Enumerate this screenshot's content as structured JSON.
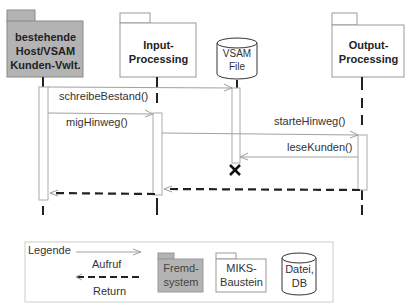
{
  "diagram": {
    "type": "sequence-diagram",
    "participants": [
      {
        "id": "host",
        "label_lines": [
          "bestehende",
          "Host/VSAM",
          "Kunden-Vwlt."
        ],
        "kind": "Fremdsystem",
        "fill": "#b3b3b3"
      },
      {
        "id": "input",
        "label_lines": [
          "Input-",
          "Processing"
        ],
        "kind": "MIKS-Baustein",
        "fill": "#ffffff"
      },
      {
        "id": "vsam",
        "label_lines": [
          "VSAM",
          "File"
        ],
        "kind": "Datei, DB",
        "fill": "#ffffff"
      },
      {
        "id": "output",
        "label_lines": [
          "Output-",
          "Processing"
        ],
        "kind": "MIKS-Baustein",
        "fill": "#ffffff"
      }
    ],
    "messages": [
      {
        "from": "host",
        "to": "vsam",
        "label": "schreibeBestand()",
        "type": "call"
      },
      {
        "from": "host",
        "to": "input",
        "label": "migHinweg()",
        "type": "call"
      },
      {
        "from": "input",
        "to": "output",
        "label": "starteHinweg()",
        "type": "call"
      },
      {
        "from": "output",
        "to": "vsam",
        "label": "leseKunden()",
        "type": "call"
      },
      {
        "from": "output",
        "to": "input",
        "label": "",
        "type": "return"
      },
      {
        "from": "input",
        "to": "host",
        "label": "",
        "type": "return"
      }
    ],
    "destroyed": [
      "vsam"
    ]
  },
  "legend": {
    "title": "Legende",
    "call_label": "Aufruf",
    "return_label": "Return",
    "external_system_lines": [
      "Fremd-",
      "system"
    ],
    "module_lines": [
      "MIKS-",
      "Baustein"
    ],
    "db_lines": [
      "Datei,",
      "DB"
    ]
  },
  "colors": {
    "external_fill": "#b3b3b3",
    "line": "#333333",
    "thin_line": "#9a9a9a"
  }
}
